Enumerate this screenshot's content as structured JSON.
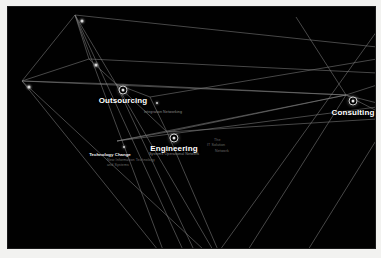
{
  "visualization": {
    "type": "network-graph",
    "background_color": "#010101",
    "frame_color": "#f2f2f0",
    "edge_color": "#9a9a9a",
    "node_color": "#d8d8d8"
  },
  "hubs": [
    {
      "id": "outsourcing",
      "label": "Outsourcing",
      "x": 115,
      "y": 83,
      "label_x": 115,
      "label_y": 89,
      "sublabel": ""
    },
    {
      "id": "engineering",
      "label": "Engineering",
      "x": 166,
      "y": 131,
      "label_x": 166,
      "label_y": 137,
      "sublabel": ""
    },
    {
      "id": "consulting",
      "label": "Consulting",
      "x": 345,
      "y": 94,
      "label_x": 345,
      "label_y": 101,
      "sublabel": ""
    }
  ],
  "secondary_labels": [
    {
      "id": "integration-networking",
      "text": "Integration Networking",
      "x": 155,
      "y": 103
    },
    {
      "id": "systems-operational-network",
      "text": "Systems Operational Network",
      "x": 166,
      "y": 145
    },
    {
      "id": "technology-change",
      "text": "Technology Change",
      "x": 102,
      "y": 146
    },
    {
      "id": "the-it-solution",
      "text": "The",
      "x": 208,
      "y": 133
    },
    {
      "id": "it-solution",
      "text": "IT Solution",
      "x": 203,
      "y": 138
    },
    {
      "id": "network-tail",
      "text": "Network",
      "x": 210,
      "y": 144
    }
  ],
  "detail_blocks": [
    {
      "id": "technology-change-detail",
      "line1": "New Information Technology",
      "line2": "and Systems",
      "x": 99,
      "y": 152
    }
  ],
  "plain_nodes": [
    {
      "id": "node-top",
      "x": 74,
      "y": 14,
      "size": "dot"
    },
    {
      "id": "node-upper-mid",
      "x": 88,
      "y": 58,
      "size": "dot"
    },
    {
      "id": "node-left",
      "x": 21,
      "y": 80,
      "size": "dot"
    },
    {
      "id": "node-small-right-of-outsourcing",
      "x": 149,
      "y": 96,
      "size": "sm"
    },
    {
      "id": "node-technology-change",
      "x": 116,
      "y": 140,
      "size": "sm"
    }
  ]
}
